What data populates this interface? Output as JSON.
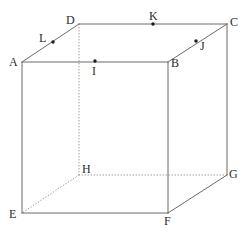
{
  "figure": {
    "type": "cube-net-diagram",
    "width": 244,
    "height": 231,
    "background_color": "#ffffff",
    "solid_edge_color": "#6b6b6b",
    "hidden_edge_color": "#9a9a9a",
    "point_color": "#1a1a1a",
    "label_color": "#2b2b2b"
  },
  "vertices": [
    {
      "id": "A",
      "label": "A",
      "x": 22,
      "y": 62,
      "label_x": 9,
      "label_y": 56,
      "hidden": false
    },
    {
      "id": "B",
      "label": "B",
      "x": 168,
      "y": 62,
      "label_x": 171,
      "label_y": 57,
      "hidden": false
    },
    {
      "id": "C",
      "label": "C",
      "x": 227,
      "y": 24,
      "label_x": 230,
      "label_y": 16,
      "hidden": false
    },
    {
      "id": "D",
      "label": "D",
      "x": 79,
      "y": 24,
      "label_x": 66,
      "label_y": 14,
      "hidden": false
    },
    {
      "id": "E",
      "label": "E",
      "x": 22,
      "y": 213,
      "label_x": 9,
      "label_y": 208,
      "hidden": false
    },
    {
      "id": "F",
      "label": "F",
      "x": 168,
      "y": 213,
      "label_x": 164,
      "label_y": 215,
      "hidden": false
    },
    {
      "id": "G",
      "label": "G",
      "x": 227,
      "y": 175,
      "label_x": 229,
      "label_y": 168,
      "hidden": false
    },
    {
      "id": "H",
      "label": "H",
      "x": 79,
      "y": 175,
      "label_x": 82,
      "label_y": 163,
      "hidden": true
    }
  ],
  "points": [
    {
      "id": "I",
      "label": "I",
      "x": 95,
      "y": 61,
      "label_x": 92,
      "label_y": 65,
      "on_edge": "AB"
    },
    {
      "id": "J",
      "label": "J",
      "x": 196,
      "y": 41,
      "label_x": 200,
      "label_y": 40,
      "on_edge": "BC"
    },
    {
      "id": "K",
      "label": "K",
      "x": 153,
      "y": 24,
      "label_x": 149,
      "label_y": 10,
      "on_edge": "DC"
    },
    {
      "id": "L",
      "label": "L",
      "x": 53,
      "y": 42,
      "label_x": 39,
      "label_y": 32,
      "on_edge": "AD"
    }
  ],
  "edges": [
    {
      "id": "AB",
      "from": "A",
      "to": "B",
      "hidden": false
    },
    {
      "id": "BC",
      "from": "B",
      "to": "C",
      "hidden": false
    },
    {
      "id": "CD",
      "from": "C",
      "to": "D",
      "hidden": false
    },
    {
      "id": "DA",
      "from": "D",
      "to": "A",
      "hidden": false
    },
    {
      "id": "EF",
      "from": "E",
      "to": "F",
      "hidden": false
    },
    {
      "id": "FG",
      "from": "F",
      "to": "G",
      "hidden": false
    },
    {
      "id": "GH",
      "from": "G",
      "to": "H",
      "hidden": true
    },
    {
      "id": "HE",
      "from": "H",
      "to": "E",
      "hidden": true
    },
    {
      "id": "AE",
      "from": "A",
      "to": "E",
      "hidden": false
    },
    {
      "id": "BF",
      "from": "B",
      "to": "F",
      "hidden": false
    },
    {
      "id": "CG",
      "from": "C",
      "to": "G",
      "hidden": false
    },
    {
      "id": "DH",
      "from": "D",
      "to": "H",
      "hidden": true
    }
  ]
}
